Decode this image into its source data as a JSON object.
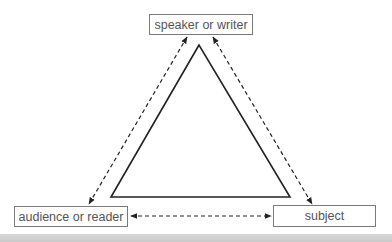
{
  "diagram": {
    "nodes": {
      "speaker": "speaker or writer",
      "audience": "audience or reader",
      "subject": "subject"
    },
    "edges": [
      {
        "from": "speaker",
        "to": "audience",
        "style": "dashed",
        "arrows": "both"
      },
      {
        "from": "speaker",
        "to": "subject",
        "style": "dashed",
        "arrows": "both"
      },
      {
        "from": "audience",
        "to": "subject",
        "style": "dashed",
        "arrows": "both"
      }
    ],
    "colors": {
      "line": "#222222",
      "box_border": "#7a7a7a",
      "text": "#555555",
      "bottom_bar": "#cfcfcf"
    }
  }
}
